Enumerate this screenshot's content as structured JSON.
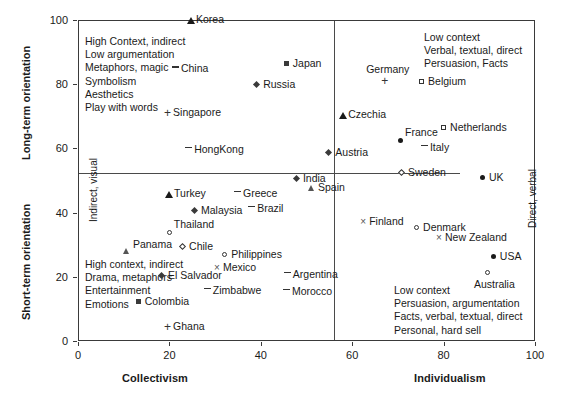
{
  "chart_data": {
    "type": "scatter",
    "title": "",
    "xlabel": "Collectivism / Individualism",
    "ylabel": "Long-term orientation / Short-term orientation",
    "xlim": [
      0,
      100
    ],
    "ylim": [
      0,
      100
    ],
    "xticks": [
      0,
      20,
      40,
      60,
      80,
      100
    ],
    "yticks": [
      0,
      20,
      40,
      60,
      80,
      100
    ],
    "grid": false,
    "legend": "none",
    "axis_labels": {
      "x_left": "Collectivism",
      "x_right": "Individualism",
      "y_top": "Long-term orientation",
      "y_bottom": "Short-term orientation"
    },
    "inner_axis_notes": {
      "left": "Indirect, visual",
      "right": "Direct, verbal"
    },
    "quadrant_notes": {
      "top_left": [
        "High Context, indirect",
        "Low argumentation",
        "Metaphors, magic",
        "Symbolism",
        "Aesthetics",
        "Play with words"
      ],
      "top_right": [
        "Low context",
        "Verbal, textual, direct",
        "Persuasion, Facts"
      ],
      "bottom_left": [
        "High context, indirect",
        "Drama, metaphors",
        "Entertainment",
        "Emotions"
      ],
      "bottom_right": [
        "Low context",
        "Persuasion, argumentation",
        "Facts, verbal, textual, direct",
        "Personal, hard sell"
      ]
    },
    "divider_x": 56,
    "divider_y": 52,
    "points": [
      {
        "label": "Korea",
        "x": 24.5,
        "y": 100.0,
        "marker": "filled-triangle",
        "label_pos": "right"
      },
      {
        "label": "China",
        "x": 21.2,
        "y": 84.7,
        "marker": "dash",
        "label_pos": "right"
      },
      {
        "label": "Japan",
        "x": 45.7,
        "y": 86.3,
        "marker": "filled-square",
        "label_pos": "right"
      },
      {
        "label": "Russia",
        "x": 39.2,
        "y": 79.8,
        "marker": "diamond",
        "label_pos": "right"
      },
      {
        "label": "Germany",
        "x": 67.0,
        "y": 81.0,
        "marker": "plus",
        "label_pos": "above"
      },
      {
        "label": "Belgium",
        "x": 75.3,
        "y": 80.7,
        "marker": "open-square",
        "label_pos": "right"
      },
      {
        "label": "Singapore",
        "x": 19.5,
        "y": 71.0,
        "marker": "plus",
        "label_pos": "right"
      },
      {
        "label": "Czechia",
        "x": 57.8,
        "y": 70.4,
        "marker": "filled-triangle",
        "label_pos": "right"
      },
      {
        "label": "Netherlands",
        "x": 80.1,
        "y": 66.4,
        "marker": "open-square",
        "label_pos": "right"
      },
      {
        "label": "France",
        "x": 70.7,
        "y": 62.3,
        "marker": "filled-circle",
        "label_pos": "above-right"
      },
      {
        "label": "Italy",
        "x": 75.7,
        "y": 60.1,
        "marker": "dash",
        "label_pos": "right"
      },
      {
        "label": "HongKong",
        "x": 24.1,
        "y": 59.5,
        "marker": "dash",
        "label_pos": "right"
      },
      {
        "label": "Austria",
        "x": 55.0,
        "y": 58.6,
        "marker": "diamond",
        "label_pos": "right"
      },
      {
        "label": "Sweden",
        "x": 70.9,
        "y": 52.3,
        "marker": "open-diamond",
        "label_pos": "right"
      },
      {
        "label": "UK",
        "x": 88.6,
        "y": 50.8,
        "marker": "filled-circle",
        "label_pos": "right"
      },
      {
        "label": "India",
        "x": 47.9,
        "y": 50.5,
        "marker": "diamond",
        "label_pos": "right"
      },
      {
        "label": "Spain",
        "x": 51.2,
        "y": 47.7,
        "marker": "open-triangle",
        "label_pos": "right"
      },
      {
        "label": "Turkey",
        "x": 19.7,
        "y": 45.8,
        "marker": "filled-triangle",
        "label_pos": "right"
      },
      {
        "label": "Greece",
        "x": 34.8,
        "y": 45.8,
        "marker": "dash",
        "label_pos": "right"
      },
      {
        "label": "Malaysia",
        "x": 25.6,
        "y": 40.5,
        "marker": "diamond",
        "label_pos": "right"
      },
      {
        "label": "Brazil",
        "x": 37.9,
        "y": 41.1,
        "marker": "dash",
        "label_pos": "right"
      },
      {
        "label": "Finland",
        "x": 62.4,
        "y": 37.1,
        "marker": "cross",
        "label_pos": "right"
      },
      {
        "label": "Denmark",
        "x": 74.2,
        "y": 35.2,
        "marker": "open-circle",
        "label_pos": "right"
      },
      {
        "label": "New Zealand",
        "x": 79.0,
        "y": 32.1,
        "marker": "cross",
        "label_pos": "right"
      },
      {
        "label": "Thailand",
        "x": 20.1,
        "y": 33.6,
        "marker": "open-circle",
        "label_pos": "above-right"
      },
      {
        "label": "Panama",
        "x": 10.7,
        "y": 30.0,
        "marker": "open-triangle",
        "label_pos": "right"
      },
      {
        "label": "Chile",
        "x": 23.0,
        "y": 29.3,
        "marker": "open-diamond",
        "label_pos": "right"
      },
      {
        "label": "Philippines",
        "x": 32.2,
        "y": 26.8,
        "marker": "open-circle",
        "label_pos": "right"
      },
      {
        "label": "Mexico",
        "x": 30.4,
        "y": 22.7,
        "marker": "cross",
        "label_pos": "right"
      },
      {
        "label": "USA",
        "x": 91.0,
        "y": 26.2,
        "marker": "filled-circle",
        "label_pos": "right"
      },
      {
        "label": "Australia",
        "x": 89.7,
        "y": 21.2,
        "marker": "open-circle",
        "label_pos": "below"
      },
      {
        "label": "El Salvador",
        "x": 18.4,
        "y": 20.2,
        "marker": "diamond",
        "label_pos": "right"
      },
      {
        "label": "Argentina",
        "x": 45.7,
        "y": 20.6,
        "marker": "dash",
        "label_pos": "right"
      },
      {
        "label": "Zimbabwe",
        "x": 28.2,
        "y": 15.6,
        "marker": "dash",
        "label_pos": "right"
      },
      {
        "label": "Morocco",
        "x": 45.5,
        "y": 15.3,
        "marker": "dash",
        "label_pos": "right"
      },
      {
        "label": "Colombia",
        "x": 13.3,
        "y": 12.1,
        "marker": "filled-square",
        "label_pos": "right"
      },
      {
        "label": "Ghana",
        "x": 19.5,
        "y": 4.4,
        "marker": "plus",
        "label_pos": "right"
      }
    ]
  }
}
